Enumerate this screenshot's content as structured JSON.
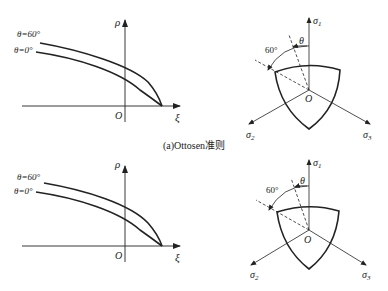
{
  "caption_a": "(a)Ottosen准则",
  "panel_top": {
    "meridian": {
      "curve_labels": [
        "θ=60°",
        "θ=0°"
      ],
      "y_axis_label": "ρ",
      "x_axis_label": "ξ",
      "origin_label": "O"
    },
    "deviatoric": {
      "axis_labels": [
        "σ",
        "σ",
        "σ"
      ],
      "axis_subscripts": [
        "1",
        "2",
        "3"
      ],
      "angle_labels": [
        "60°",
        "θ"
      ],
      "origin_label": "O"
    }
  },
  "panel_bottom": {
    "meridian": {
      "curve_labels": [
        "θ=60°",
        "θ=0°"
      ],
      "y_axis_label": "ρ",
      "x_axis_label": "ξ",
      "origin_label": "O"
    },
    "deviatoric": {
      "axis_labels": [
        "σ",
        "σ",
        "σ"
      ],
      "axis_subscripts": [
        "1",
        "2",
        "3"
      ],
      "angle_labels": [
        "60°",
        "θ"
      ],
      "origin_label": "O"
    }
  }
}
